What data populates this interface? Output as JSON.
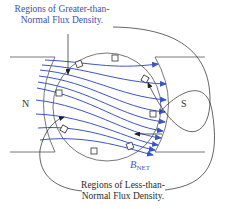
{
  "diagram": {
    "labels": {
      "greater_line1": "Regions of Greater-than-",
      "greater_line2": "Normal Flux Density.",
      "less_line1": "Regions of Less-than-",
      "less_line2": "Normal Flux Density.",
      "north_pole": "N",
      "south_pole": "S",
      "bnet_main": "B",
      "bnet_sub": "NET"
    },
    "colors": {
      "flux_lines": "#3a55c8",
      "label_blue": "#3d4fa8",
      "outline": "#555555",
      "text": "#2a2a2a"
    },
    "components": [
      "north-pole-piece",
      "south-pole-piece",
      "rotor",
      "rotor-conductor-slots",
      "flux-lines",
      "bnet-vector",
      "callout-lines"
    ]
  }
}
